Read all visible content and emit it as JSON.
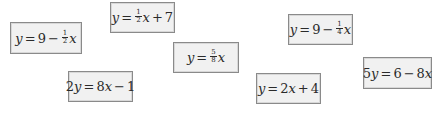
{
  "cards": [
    {
      "id": "A",
      "lhs": "y",
      "eq": "=",
      "c": "9",
      "op": "−",
      "num": "1",
      "den": "2",
      "var": "x",
      "pos": {
        "left": 10,
        "top": 22,
        "w": 72,
        "h": 32
      }
    },
    {
      "id": "B",
      "lhs": "y",
      "eq": "=",
      "num": "1",
      "den": "2",
      "var": "x",
      "op": "+",
      "c": "7",
      "pos": {
        "left": 110,
        "top": 2,
        "w": 65,
        "h": 31
      }
    },
    {
      "id": "C",
      "lhs": "y",
      "eq": "=",
      "num": "5",
      "den": "8",
      "var": "x",
      "pos": {
        "left": 173,
        "top": 42,
        "w": 66,
        "h": 31
      }
    },
    {
      "id": "D",
      "lhs": "y",
      "eq": "=",
      "c": "9",
      "op": "−",
      "num": "1",
      "den": "4",
      "var": "x",
      "pos": {
        "left": 288,
        "top": 14,
        "w": 65,
        "h": 31
      }
    },
    {
      "id": "E",
      "lhs": "2y",
      "eq": "=",
      "a": "8x",
      "op": "−",
      "c": "1",
      "pos": {
        "left": 68,
        "top": 71,
        "w": 65,
        "h": 31
      }
    },
    {
      "id": "F",
      "lhs": "y",
      "eq": "=",
      "a": "2x",
      "op": "+",
      "c": "4",
      "pos": {
        "left": 256,
        "top": 73,
        "w": 65,
        "h": 31
      }
    },
    {
      "id": "G",
      "lhs": "5y",
      "eq": "=",
      "c": "6",
      "op": "−",
      "a": "8x",
      "pos": {
        "left": 363,
        "top": 57,
        "w": 69,
        "h": 32
      }
    }
  ],
  "labels": {
    "A": {
      "lhs": "y",
      "eq": "=",
      "const": "9",
      "op": "−",
      "num": "1",
      "den": "2",
      "var": "x"
    },
    "B": {
      "lhs": "y",
      "eq": "=",
      "num": "1",
      "den": "2",
      "var": "x",
      "op": "+",
      "const": "7"
    },
    "C": {
      "lhs": "y",
      "eq": "=",
      "num": "5",
      "den": "8",
      "var": "x"
    },
    "D": {
      "lhs": "y",
      "eq": "=",
      "const": "9",
      "op": "−",
      "num": "1",
      "den": "4",
      "var": "x"
    },
    "E": {
      "coef": "2",
      "lhs": "y",
      "eq": "=",
      "a_coef": "8",
      "a_var": "x",
      "op": "−",
      "const": "1"
    },
    "F": {
      "lhs": "y",
      "eq": "=",
      "a_coef": "2",
      "a_var": "x",
      "op": "+",
      "const": "4"
    },
    "G": {
      "coef": "5",
      "lhs": "y",
      "eq": "=",
      "const": "6",
      "op": "−",
      "a_coef": "8",
      "a_var": "x"
    }
  }
}
